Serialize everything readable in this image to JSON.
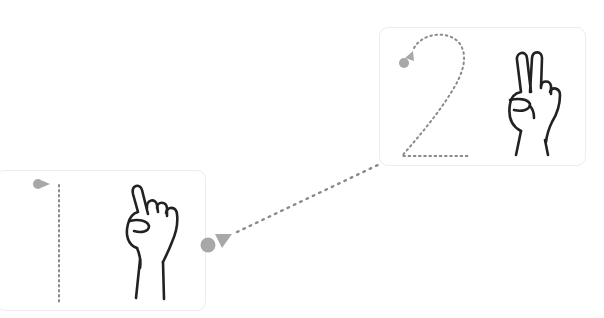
{
  "worksheet": {
    "title": "Number tracing with finger counting",
    "colors": {
      "trace_dots": "#8a8a8a",
      "start_marker": "#a8a8a8",
      "hand_outline": "#222222",
      "card_border": "#ececec"
    },
    "cards": [
      {
        "number": "1",
        "fingers_raised": 1,
        "hand_icon": "one-finger-hand-icon"
      },
      {
        "number": "2",
        "fingers_raised": 2,
        "hand_icon": "two-finger-hand-icon"
      }
    ],
    "connector": {
      "from": "1",
      "to": "2",
      "style": "dotted-arrow"
    }
  }
}
